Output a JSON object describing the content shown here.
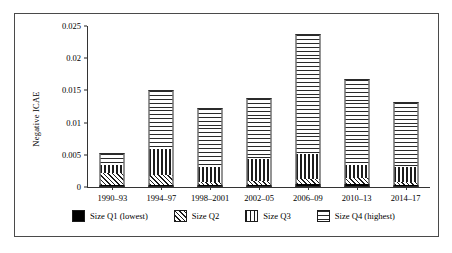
{
  "chart_data": {
    "type": "bar",
    "subtype": "stacked-bar",
    "title": "",
    "xlabel": "",
    "ylabel": "Negative ICAE",
    "ylim": [
      0,
      0.025
    ],
    "yticks": [
      "0",
      "0.005",
      "0.01",
      "0.015",
      "0.02",
      "0.025"
    ],
    "ytick_values": [
      0,
      0.005,
      0.01,
      0.015,
      0.02,
      0.025
    ],
    "grid": false,
    "legend_position": "bottom",
    "categories": [
      "1990–93",
      "1994–97",
      "1998–2001",
      "2002–05",
      "2006–09",
      "2010–13",
      "2014–17"
    ],
    "series": [
      {
        "name": "Size Q1 (lowest)",
        "pattern": "solid-black",
        "values": [
          0.0003,
          0.0003,
          0.0003,
          0.0003,
          0.0004,
          0.0004,
          0.0003
        ]
      },
      {
        "name": "Size Q2",
        "pattern": "diagonal-hatch",
        "values": [
          0.0019,
          0.0016,
          0.0005,
          0.0007,
          0.0008,
          0.001,
          0.0005
        ]
      },
      {
        "name": "Size Q3",
        "pattern": "vertical-lines",
        "values": [
          0.0012,
          0.004,
          0.0023,
          0.0034,
          0.004,
          0.002,
          0.0023
        ]
      },
      {
        "name": "Size Q4 (highest)",
        "pattern": "horizontal-lines",
        "values": [
          0.0019,
          0.0092,
          0.0092,
          0.0094,
          0.0185,
          0.0133,
          0.0101
        ]
      }
    ],
    "totals": [
      0.0053,
      0.0151,
      0.0123,
      0.0138,
      0.0237,
      0.0167,
      0.0132
    ]
  },
  "axis": {
    "y_label": "Negative ICAE",
    "y_ticks": [
      "0.025",
      "0.02",
      "0.015",
      "0.01",
      "0.005",
      "0"
    ],
    "x_labels": [
      "1990–93",
      "1994–97",
      "1998–2001",
      "2002–05",
      "2006–09",
      "2010–13",
      "2014–17"
    ]
  },
  "legend": {
    "items": [
      {
        "label": "Size Q1 (lowest)",
        "pattern": "solid-black"
      },
      {
        "label": "Size Q2",
        "pattern": "diagonal-hatch"
      },
      {
        "label": "Size Q3",
        "pattern": "vertical-lines"
      },
      {
        "label": "Size Q4 (highest)",
        "pattern": "horizontal-lines"
      }
    ]
  },
  "colors": {
    "line": "#2b2b2b",
    "frame": "#4a4a4a",
    "fill": "#ffffff",
    "ink": "#000000"
  }
}
